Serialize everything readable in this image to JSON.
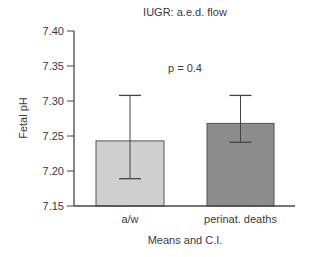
{
  "chart_data": {
    "type": "bar",
    "title": "IUGR: a.e.d. flow",
    "xlabel": "Means and C.I.",
    "ylabel": "Fetal pH",
    "ylim": [
      7.15,
      7.4
    ],
    "yticks": [
      "7.40",
      "7.35",
      "7.30",
      "7.25",
      "7.20",
      "7.15"
    ],
    "categories": [
      "a/w",
      "perinat. deaths"
    ],
    "values": [
      7.243,
      7.268
    ],
    "error_bars": [
      {
        "lower": 7.189,
        "upper": 7.308
      },
      {
        "lower": 7.241,
        "upper": 7.308
      }
    ],
    "bar_colors": [
      "#cfcfcf",
      "#8c8c8c"
    ],
    "annotation": "p = 0.4",
    "grid": false,
    "legend": null
  }
}
